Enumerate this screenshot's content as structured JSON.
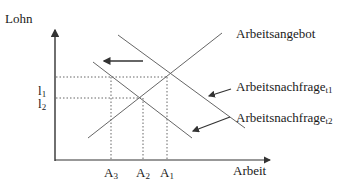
{
  "diagram": {
    "type": "supply-demand",
    "y_axis_label": "Lohn",
    "x_axis_label": "Arbeit",
    "curves": {
      "supply": {
        "label": "Arbeitsangebot"
      },
      "demand_t1": {
        "label": "Arbeitsnachfrage",
        "subscript": "t1"
      },
      "demand_t2": {
        "label": "Arbeitsnachfrage",
        "subscript": "t2"
      }
    },
    "y_ticks": [
      {
        "label": "l",
        "subscript": "1"
      },
      {
        "label": "l",
        "subscript": "2"
      }
    ],
    "x_ticks": [
      {
        "label": "A",
        "subscript": "3"
      },
      {
        "label": "A",
        "subscript": "2"
      },
      {
        "label": "A",
        "subscript": "1"
      }
    ],
    "shift_arrow_direction": "left",
    "colors": {
      "line": "#555555",
      "axis": "#333333",
      "text": "#1a1a1a"
    }
  }
}
